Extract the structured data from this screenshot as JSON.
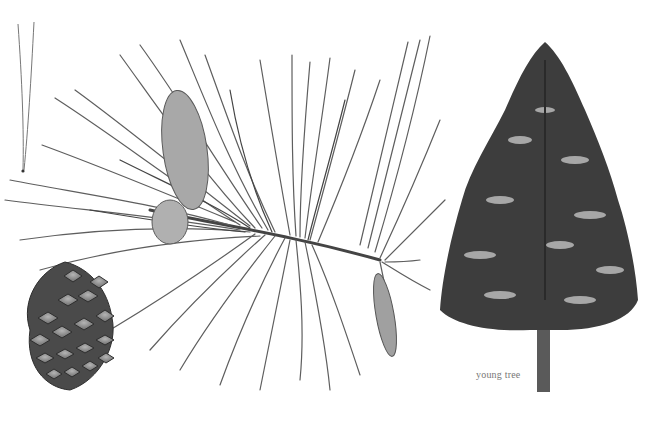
{
  "illustration": {
    "subject": "pine tree botanical plate",
    "style": "grayscale pencil illustration",
    "palette": {
      "background": "#ffffff",
      "needle": "#6e6e6e",
      "needle_dark": "#4a4a4a",
      "cone_fill": "#9a9a9a",
      "cone_edge": "#3a3a3a",
      "foliage": "#3d3d3d",
      "trunk": "#5a5a5a"
    },
    "parts": [
      {
        "id": "needle-fascicle",
        "description": "single needle fascicle"
      },
      {
        "id": "mature-cone",
        "description": "open seed cone"
      },
      {
        "id": "branch",
        "description": "branch with long needles and closed cones"
      },
      {
        "id": "young-tree",
        "description": "young tree silhouette"
      }
    ],
    "labels": {
      "young_tree": "young tree"
    }
  }
}
